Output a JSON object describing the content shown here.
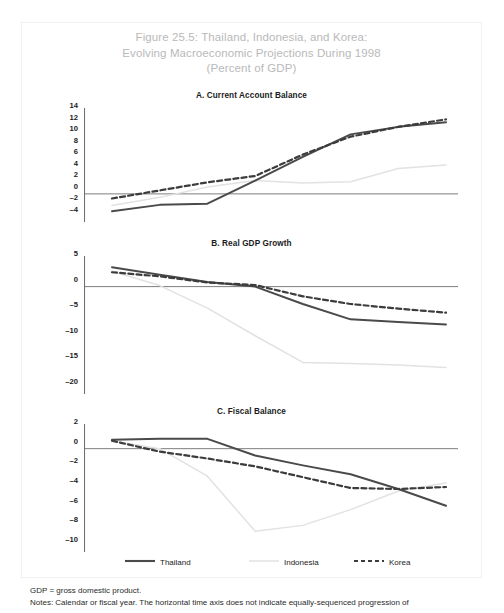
{
  "figure": {
    "title_lines": [
      "Figure 25.5: Thailand, Indonesia, and Korea:",
      "Evolving Macroeconomic Projections During 1998",
      "(Percent of GDP)"
    ],
    "title_color": "#b9b9b9"
  },
  "legend": {
    "items": [
      {
        "label": "Thailand",
        "style": "solid",
        "color": "#4a4a4a"
      },
      {
        "label": "Indonesia",
        "style": "solid",
        "color": "#e2e2e2"
      },
      {
        "label": "Korea",
        "style": "dashed",
        "color": "#3c3c3c"
      }
    ]
  },
  "notes": {
    "line1": "GDP = gross domestic product.",
    "line2": "Notes: Calendar or fiscal year. The horizontal time axis does not indicate equally-sequenced progression of"
  },
  "chart_data": [
    {
      "id": "panel-a",
      "type": "line",
      "title": "A. Current Account Balance",
      "xlabel": "",
      "ylabel": "",
      "ylim": [
        -4,
        14
      ],
      "yticks": [
        14,
        12,
        10,
        8,
        6,
        4,
        2,
        0,
        -2,
        -4
      ],
      "ytick_labels": [
        "14",
        "12",
        "10",
        "8",
        "6",
        "4",
        "2",
        "0",
        "–2",
        "–4"
      ],
      "grid": false,
      "zero_line": true,
      "x": [
        0,
        1,
        2,
        3,
        4,
        5,
        6,
        7
      ],
      "series": [
        {
          "name": "Thailand",
          "style": "solid",
          "color": "#4a4a4a",
          "values": [
            -3.0,
            -1.9,
            -1.7,
            2.3,
            6.4,
            10.3,
            11.6,
            12.4
          ]
        },
        {
          "name": "Indonesia",
          "style": "solid",
          "color": "#e2e2e2",
          "values": [
            -2.0,
            -0.6,
            1.2,
            2.3,
            1.9,
            2.1,
            4.4,
            5.0
          ]
        },
        {
          "name": "Korea",
          "style": "dashed",
          "color": "#3c3c3c",
          "values": [
            -0.8,
            0.6,
            2.0,
            3.1,
            6.8,
            9.9,
            11.6,
            12.9
          ]
        }
      ]
    },
    {
      "id": "panel-b",
      "type": "line",
      "title": "B. Real GDP Growth",
      "xlabel": "",
      "ylabel": "",
      "ylim": [
        -20,
        5
      ],
      "yticks": [
        5,
        0,
        -5,
        -10,
        -15,
        -20
      ],
      "ytick_labels": [
        "5",
        "0",
        "–5",
        "–10",
        "–15",
        "–20"
      ],
      "grid": false,
      "zero_line": true,
      "x": [
        0,
        1,
        2,
        3,
        4,
        5,
        6,
        7
      ],
      "series": [
        {
          "name": "Thailand",
          "style": "solid",
          "color": "#4a4a4a",
          "values": [
            3.8,
            2.3,
            0.9,
            0.0,
            -3.4,
            -6.4,
            -6.9,
            -7.4
          ]
        },
        {
          "name": "Indonesia",
          "style": "solid",
          "color": "#e2e2e2",
          "values": [
            3.0,
            0.2,
            -4.2,
            -9.6,
            -14.8,
            -15.0,
            -15.3,
            -15.8
          ]
        },
        {
          "name": "Korea",
          "style": "dashed",
          "color": "#3c3c3c",
          "values": [
            2.8,
            2.0,
            0.8,
            0.3,
            -1.9,
            -3.4,
            -4.3,
            -5.1
          ]
        }
      ]
    },
    {
      "id": "panel-c",
      "type": "line",
      "title": "C. Fiscal Balance",
      "xlabel": "",
      "ylabel": "",
      "ylim": [
        -10,
        2
      ],
      "yticks": [
        2,
        0,
        -2,
        -4,
        -6,
        -8,
        -10
      ],
      "ytick_labels": [
        "2",
        "0",
        "–2",
        "–4",
        "–6",
        "–8",
        "–10"
      ],
      "grid": false,
      "zero_line": true,
      "x": [
        0,
        1,
        2,
        3,
        4,
        5,
        6,
        7
      ],
      "series": [
        {
          "name": "Thailand",
          "style": "solid",
          "color": "#4a4a4a",
          "values": [
            0.9,
            1.0,
            1.0,
            -0.7,
            -1.7,
            -2.6,
            -4.1,
            -5.8
          ]
        },
        {
          "name": "Indonesia",
          "style": "solid",
          "color": "#e2e2e2",
          "values": [
            0.8,
            0.0,
            -2.8,
            -8.4,
            -7.8,
            -6.2,
            -4.3,
            -3.5
          ]
        },
        {
          "name": "Korea",
          "style": "dashed",
          "color": "#3c3c3c",
          "values": [
            0.8,
            -0.3,
            -1.0,
            -1.8,
            -2.9,
            -4.0,
            -4.1,
            -3.9
          ]
        }
      ]
    }
  ]
}
